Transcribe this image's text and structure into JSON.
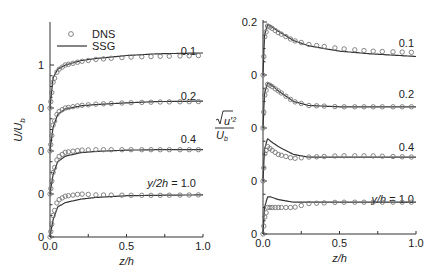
{
  "chart_data": [
    {
      "type": "line",
      "title": "",
      "xlabel": "z/h",
      "ylabel": "U/U_b",
      "xlim": [
        0.0,
        1.0
      ],
      "xticks": [
        "0.0",
        "0.5",
        "1.0"
      ],
      "yticks_labels": [
        "0",
        "0",
        "0",
        "0",
        "1"
      ],
      "layout": "stacked profiles offset by 1.0",
      "legend": [
        {
          "name": "DNS",
          "marker": "open-circle"
        },
        {
          "name": "SSG",
          "marker": "line"
        }
      ],
      "legend_position": "upper-left",
      "profiles": [
        {
          "label": "y/2h = 1.0",
          "offset": 3,
          "series": [
            {
              "name": "SSG",
              "x": [
                0,
                0.02,
                0.05,
                0.1,
                0.2,
                0.3,
                0.5,
                0.7,
                1.0
              ],
              "y": [
                0,
                0.7,
                0.9,
                1.0,
                1.1,
                1.15,
                1.22,
                1.26,
                1.28
              ]
            },
            {
              "name": "DNS",
              "x": [
                0,
                0.02,
                0.05,
                0.1,
                0.2,
                0.3,
                0.5,
                0.7,
                1.0
              ],
              "y": [
                0,
                0.6,
                0.88,
                1.0,
                1.08,
                1.13,
                1.18,
                1.2,
                1.22
              ]
            }
          ]
        },
        {
          "label": "0.4",
          "offset": 2,
          "series": [
            {
              "name": "SSG",
              "x": [
                0,
                0.02,
                0.05,
                0.1,
                0.2,
                0.3,
                0.5,
                0.7,
                1.0
              ],
              "y": [
                0,
                0.55,
                0.85,
                0.98,
                1.05,
                1.08,
                1.12,
                1.15,
                1.16
              ]
            },
            {
              "name": "DNS",
              "x": [
                0,
                0.02,
                0.05,
                0.1,
                0.2,
                0.3,
                0.5,
                0.7,
                1.0
              ],
              "y": [
                0,
                0.6,
                0.9,
                1.0,
                1.06,
                1.09,
                1.12,
                1.14,
                1.15
              ]
            }
          ]
        },
        {
          "label": "0.2",
          "offset": 1,
          "series": [
            {
              "name": "SSG",
              "x": [
                0,
                0.02,
                0.05,
                0.1,
                0.2,
                0.3,
                0.5,
                0.7,
                1.0
              ],
              "y": [
                0,
                0.45,
                0.75,
                0.88,
                0.96,
                0.99,
                1.02,
                1.03,
                1.03
              ]
            },
            {
              "name": "DNS",
              "x": [
                0,
                0.02,
                0.05,
                0.1,
                0.2,
                0.3,
                0.5,
                0.7,
                1.0
              ],
              "y": [
                0,
                0.5,
                0.85,
                0.97,
                1.02,
                1.03,
                1.03,
                1.03,
                1.03
              ]
            }
          ]
        },
        {
          "label": "0.1",
          "offset": 0,
          "series": [
            {
              "name": "SSG",
              "x": [
                0,
                0.02,
                0.05,
                0.1,
                0.2,
                0.3,
                0.5,
                0.7,
                1.0
              ],
              "y": [
                0,
                0.4,
                0.7,
                0.8,
                0.88,
                0.92,
                0.96,
                0.97,
                0.98
              ]
            },
            {
              "name": "DNS",
              "x": [
                0,
                0.02,
                0.05,
                0.1,
                0.2,
                0.3,
                0.5,
                0.7,
                1.0
              ],
              "y": [
                0,
                0.5,
                0.85,
                0.95,
                1.0,
                0.98,
                0.97,
                0.97,
                0.98
              ]
            }
          ]
        }
      ]
    },
    {
      "type": "line",
      "title": "",
      "xlabel": "z/h",
      "ylabel": "sqrt(u'^2)/U_b",
      "xlim": [
        0.0,
        1.0
      ],
      "xticks": [
        "0.0",
        "0.5",
        "1.0"
      ],
      "yticks_labels": [
        "0",
        "0",
        "0",
        "0",
        "0.2"
      ],
      "layout": "stacked profiles offset by 0.2",
      "profiles": [
        {
          "label": "y/h = 1.0",
          "offset": 0.6,
          "series": [
            {
              "name": "SSG",
              "x": [
                0,
                0.01,
                0.03,
                0.05,
                0.1,
                0.2,
                0.3,
                0.5,
                0.7,
                1.0
              ],
              "y": [
                0,
                0.15,
                0.19,
                0.185,
                0.165,
                0.13,
                0.11,
                0.09,
                0.08,
                0.07
              ]
            },
            {
              "name": "DNS",
              "x": [
                0,
                0.01,
                0.03,
                0.05,
                0.1,
                0.2,
                0.3,
                0.5,
                0.7,
                1.0
              ],
              "y": [
                0,
                0.14,
                0.185,
                0.18,
                0.16,
                0.13,
                0.115,
                0.1,
                0.09,
                0.085
              ]
            }
          ]
        },
        {
          "label": "0.4",
          "offset": 0.4,
          "series": [
            {
              "name": "SSG",
              "x": [
                0,
                0.01,
                0.03,
                0.05,
                0.1,
                0.2,
                0.3,
                0.5,
                0.7,
                1.0
              ],
              "y": [
                0,
                0.13,
                0.17,
                0.165,
                0.14,
                0.1,
                0.085,
                0.08,
                0.08,
                0.08
              ]
            },
            {
              "name": "DNS",
              "x": [
                0,
                0.01,
                0.03,
                0.05,
                0.1,
                0.2,
                0.3,
                0.5,
                0.7,
                1.0
              ],
              "y": [
                0,
                0.12,
                0.165,
                0.16,
                0.14,
                0.1,
                0.085,
                0.08,
                0.08,
                0.08
              ]
            }
          ]
        },
        {
          "label": "0.2",
          "offset": 0.2,
          "series": [
            {
              "name": "SSG",
              "x": [
                0,
                0.01,
                0.03,
                0.05,
                0.1,
                0.2,
                0.3,
                0.5,
                0.7,
                1.0
              ],
              "y": [
                0,
                0.12,
                0.16,
                0.15,
                0.13,
                0.1,
                0.09,
                0.09,
                0.09,
                0.09
              ]
            },
            {
              "name": "DNS",
              "x": [
                0,
                0.01,
                0.03,
                0.05,
                0.1,
                0.2,
                0.3,
                0.5,
                0.7,
                1.0
              ],
              "y": [
                0,
                0.1,
                0.13,
                0.12,
                0.1,
                0.085,
                0.09,
                0.095,
                0.095,
                0.09
              ]
            }
          ]
        },
        {
          "label": "0.1",
          "offset": 0.0,
          "series": [
            {
              "name": "SSG",
              "x": [
                0,
                0.01,
                0.03,
                0.05,
                0.1,
                0.2,
                0.3,
                0.5,
                0.7,
                1.0
              ],
              "y": [
                0,
                0.1,
                0.14,
                0.14,
                0.13,
                0.12,
                0.12,
                0.12,
                0.12,
                0.12
              ]
            },
            {
              "name": "DNS",
              "x": [
                0,
                0.01,
                0.03,
                0.05,
                0.1,
                0.2,
                0.3,
                0.5,
                0.7,
                1.0
              ],
              "y": [
                0,
                0.06,
                0.1,
                0.1,
                0.1,
                0.1,
                0.115,
                0.12,
                0.12,
                0.12
              ]
            }
          ]
        }
      ]
    }
  ]
}
